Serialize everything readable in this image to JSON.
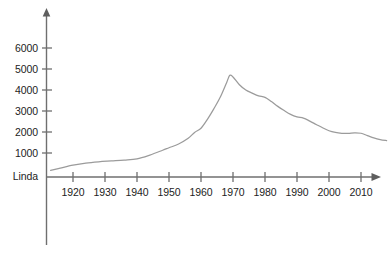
{
  "chart_data": {
    "type": "line",
    "title": "",
    "subtitle": "",
    "xlabel": "",
    "ylabel": "",
    "series_name": "Linda",
    "baseline_label": "Linda",
    "x_tick_labels": [
      "1920",
      "1930",
      "1940",
      "1950",
      "1960",
      "1970",
      "1980",
      "1990",
      "2000",
      "2010"
    ],
    "x_ticks": [
      1920,
      1930,
      1940,
      1950,
      1960,
      1970,
      1980,
      1990,
      2000,
      2010
    ],
    "y_tick_labels": [
      "1000",
      "2000",
      "3000",
      "4000",
      "5000",
      "6000"
    ],
    "y_ticks": [
      1000,
      2000,
      3000,
      4000,
      5000,
      6000
    ],
    "xlim": [
      1913,
      2020
    ],
    "ylim": [
      0,
      6800
    ],
    "grid": false,
    "legend": false,
    "legend_position": "none",
    "line_color": "#9b9b9b",
    "axis_color": "#6f6f6f",
    "text_color": "#1d1d1d",
    "background_color": "#ffffff",
    "x": [
      1913,
      1916,
      1920,
      1924,
      1928,
      1932,
      1936,
      1940,
      1944,
      1948,
      1950,
      1953,
      1956,
      1958,
      1960,
      1962,
      1964,
      1966,
      1968,
      1969,
      1970,
      1972,
      1974,
      1976,
      1978,
      1980,
      1982,
      1984,
      1986,
      1988,
      1990,
      1992,
      1994,
      1996,
      1998,
      2000,
      2002,
      2004,
      2006,
      2008,
      2010,
      2012,
      2014,
      2016,
      2018
    ],
    "values": [
      170,
      280,
      420,
      520,
      580,
      620,
      660,
      720,
      900,
      1130,
      1250,
      1430,
      1700,
      1980,
      2180,
      2600,
      3100,
      3650,
      4350,
      4700,
      4620,
      4250,
      4000,
      3850,
      3720,
      3650,
      3450,
      3220,
      3020,
      2840,
      2720,
      2660,
      2520,
      2360,
      2200,
      2060,
      1980,
      1940,
      1930,
      1960,
      1940,
      1830,
      1720,
      1640,
      1590
    ],
    "peak": {
      "year": 1969,
      "value": 4700
    },
    "annotations": []
  },
  "geometry": {
    "plot_left": 46,
    "plot_baseline_y": 177,
    "x_per_decade": 32,
    "x_at_1920": 73,
    "y_at_1000": 153,
    "y_per_1000": 21,
    "y_axis_top": 10,
    "y_axis_bottom": 245,
    "x_axis_right": 381
  }
}
